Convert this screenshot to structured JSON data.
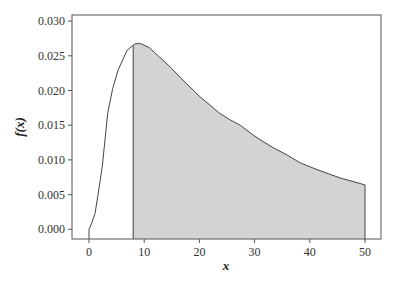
{
  "chart_data": {
    "type": "area",
    "title": "",
    "xlabel": "x",
    "ylabel": "f(x)",
    "xlim": [
      -3,
      53
    ],
    "ylim": [
      -0.0015,
      0.0305
    ],
    "xticks": [
      0,
      10,
      20,
      30,
      40,
      50
    ],
    "xtick_labels": [
      "0",
      "10",
      "20",
      "30",
      "40",
      "50"
    ],
    "yticks": [
      0.0,
      0.005,
      0.01,
      0.015,
      0.02,
      0.025,
      0.03
    ],
    "ytick_labels": [
      "0.000",
      "0.005",
      "0.010",
      "0.015",
      "0.020",
      "0.025",
      "0.030"
    ],
    "grid": false,
    "legend": null,
    "series": [
      {
        "name": "density curve",
        "x": [
          0,
          0.5,
          1.1,
          1.6,
          2.4,
          3.4,
          4.3,
          5.3,
          6.9,
          8.3,
          9.2,
          10.9,
          12.8,
          14.7,
          16.5,
          18.3,
          20.1,
          21.9,
          23.7,
          25.5,
          27.4,
          29.2,
          31.0,
          33.5,
          35.9,
          38.2,
          41.3,
          45.5,
          50.0
        ],
        "values": [
          0.0,
          0.0009,
          0.0023,
          0.0048,
          0.009,
          0.0168,
          0.0203,
          0.023,
          0.0258,
          0.0267,
          0.0268,
          0.0262,
          0.0248,
          0.0234,
          0.0219,
          0.0205,
          0.0191,
          0.0179,
          0.0167,
          0.0158,
          0.015,
          0.0139,
          0.0129,
          0.0117,
          0.0107,
          0.0096,
          0.0086,
          0.0074,
          0.0064
        ]
      }
    ],
    "shaded_region": {
      "x_from": 8,
      "x_to": 50,
      "fill": "#d3d3d3"
    },
    "annotations": []
  },
  "colors": {
    "curve": "#444444",
    "shade": "#d3d3d3",
    "frame": "#555555",
    "background": "#ffffff"
  }
}
